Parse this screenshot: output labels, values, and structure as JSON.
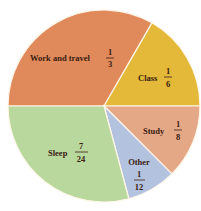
{
  "chart_data": {
    "type": "pie",
    "title": "",
    "start_angle_deg": 180,
    "direction": "clockwise",
    "slices": [
      {
        "label": "Work and travel",
        "fraction": "1/3",
        "value": 0.3333,
        "num": "1",
        "den": "3",
        "color": "#e08a5c"
      },
      {
        "label": "Class",
        "fraction": "1/6",
        "value": 0.1667,
        "num": "1",
        "den": "6",
        "color": "#e4b93a"
      },
      {
        "label": "Study",
        "fraction": "1/8",
        "value": 0.125,
        "num": "1",
        "den": "8",
        "color": "#e4a887"
      },
      {
        "label": "Other",
        "fraction": "1/12",
        "value": 0.0833,
        "num": "1",
        "den": "12",
        "color": "#b3c3df"
      },
      {
        "label": "Sleep",
        "fraction": "7/24",
        "value": 0.2917,
        "num": "7",
        "den": "24",
        "color": "#b9d89e"
      }
    ]
  }
}
